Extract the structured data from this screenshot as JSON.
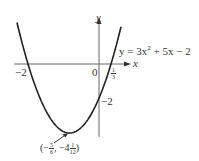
{
  "figure": {
    "equation": "y = 3x² + 5x − 2",
    "equation_parts": {
      "lhs": "y = 3x",
      "exp": "2",
      "rhs": " + 5x − 2"
    },
    "axis_labels": {
      "x": "x",
      "y": "y"
    },
    "origin_label": "0",
    "x_intercepts": {
      "left": "−2",
      "right": {
        "num": "1",
        "den": "3"
      }
    },
    "y_intercept": "−2",
    "vertex": {
      "open": "(",
      "x_sign": "−",
      "x_num": "5",
      "x_den": "6",
      "sep": ", −4",
      "y_num": "1",
      "y_den": "12",
      "close": ")"
    },
    "colors": {
      "curve": "#222222",
      "axis": "#555555"
    }
  }
}
